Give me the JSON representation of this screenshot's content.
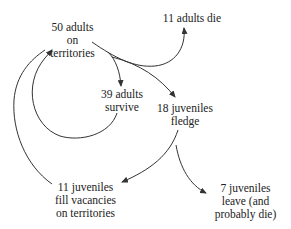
{
  "diagram": {
    "type": "population-flow",
    "nodes": {
      "adults_on_territories": {
        "lines": [
          "50 adults",
          "on",
          "territories"
        ]
      },
      "adults_die": {
        "lines": [
          "11 adults die"
        ]
      },
      "adults_survive": {
        "lines": [
          "39 adults",
          "survive"
        ]
      },
      "juveniles_fledge": {
        "lines": [
          "18 juveniles",
          "fledge"
        ]
      },
      "juveniles_fill": {
        "lines": [
          "11 juveniles",
          "fill vacancies",
          "on territories"
        ]
      },
      "juveniles_leave": {
        "lines": [
          "7 juveniles",
          "leave (and",
          "probably die)"
        ]
      }
    },
    "edges": [
      {
        "from": "adults_on_territories",
        "to": "adults_die"
      },
      {
        "from": "adults_on_territories",
        "to": "adults_survive"
      },
      {
        "from": "adults_on_territories",
        "to": "juveniles_fledge"
      },
      {
        "from": "adults_survive",
        "to": "adults_on_territories"
      },
      {
        "from": "juveniles_fledge",
        "to": "juveniles_fill"
      },
      {
        "from": "juveniles_fledge",
        "to": "juveniles_leave"
      },
      {
        "from": "juveniles_fill",
        "to": "adults_on_territories"
      }
    ],
    "colors": {
      "line": "#333333",
      "text": "#222222",
      "background": "#ffffff"
    }
  }
}
